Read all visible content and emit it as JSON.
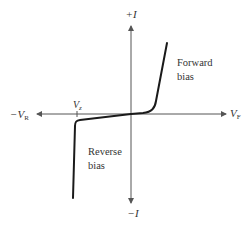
{
  "diagram": {
    "axes": {
      "y_positive_label": "+I",
      "y_negative_label": "−I",
      "x_negative_label_main": "−V",
      "x_negative_label_sub": "R",
      "x_positive_label_main": "V",
      "x_positive_label_sub": "F"
    },
    "markers": {
      "zener_label_main": "V",
      "zener_label_sub": "z"
    },
    "regions": {
      "forward_line1": "Forward",
      "forward_line2": "bias",
      "reverse_line1": "Reverse",
      "reverse_line2": "bias"
    },
    "colors": {
      "axis": "#555555",
      "curve": "#1a1a1a",
      "text": "#333333",
      "background": "#ffffff"
    }
  }
}
